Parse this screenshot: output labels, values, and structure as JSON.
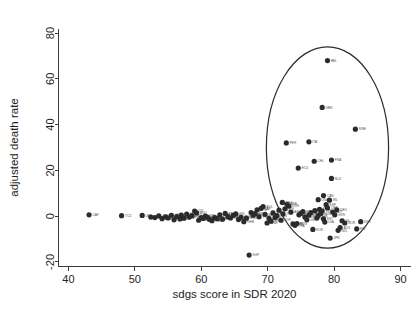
{
  "chart_data": {
    "type": "scatter",
    "title": "",
    "xlabel": "sdgs score in SDR 2020",
    "ylabel": "adjusted death rate",
    "xlim": [
      38.5,
      91.5
    ],
    "ylim": [
      -22,
      82
    ],
    "xticks": [
      40,
      50,
      60,
      70,
      80,
      90
    ],
    "yticks": [
      -20,
      0,
      20,
      40,
      60,
      80
    ],
    "grid": false,
    "legend": false,
    "marker_color": "#2b2b2b",
    "annotation": {
      "type": "ellipse",
      "label": "highlight-ellipse",
      "center_x": 79.0,
      "center_y": 30.0,
      "radius_x": 9.2,
      "radius_y": 44.0,
      "stroke": "#2f2f2f"
    },
    "points": [
      {
        "label": "CAF",
        "x": 43.1,
        "y": 0.6
      },
      {
        "label": "TCD",
        "x": 48.0,
        "y": 0.2
      },
      {
        "label": "LBR",
        "x": 51.1,
        "y": 0.3
      },
      {
        "label": "NER",
        "x": 52.4,
        "y": -0.4
      },
      {
        "label": "SOM",
        "x": 53.0,
        "y": -0.6
      },
      {
        "label": "COD",
        "x": 53.6,
        "y": 0.1
      },
      {
        "label": "SSD",
        "x": 54.1,
        "y": -1.1
      },
      {
        "label": "MLI",
        "x": 54.6,
        "y": -0.3
      },
      {
        "label": "BFA",
        "x": 55.0,
        "y": -0.8
      },
      {
        "label": "GIN",
        "x": 55.5,
        "y": 0.4
      },
      {
        "label": "MDG",
        "x": 55.9,
        "y": -1.6
      },
      {
        "label": "NGA",
        "x": 56.3,
        "y": -0.2
      },
      {
        "label": "MOZ",
        "x": 56.8,
        "y": -1.2
      },
      {
        "label": "AFG",
        "x": 57.0,
        "y": 0.5
      },
      {
        "label": "YEM",
        "x": 57.4,
        "y": -0.9
      },
      {
        "label": "SLE",
        "x": 57.8,
        "y": 0.9
      },
      {
        "label": "BEN",
        "x": 58.2,
        "y": -0.4
      },
      {
        "label": "TGO",
        "x": 58.6,
        "y": 0.2
      },
      {
        "label": "CIV",
        "x": 59.0,
        "y": 2.2
      },
      {
        "label": "AGO",
        "x": 59.3,
        "y": 1.4
      },
      {
        "label": "MWI",
        "x": 59.6,
        "y": -1.8
      },
      {
        "label": "ZMB",
        "x": 60.0,
        "y": -0.6
      },
      {
        "label": "TZA",
        "x": 60.3,
        "y": -1.0
      },
      {
        "label": "SDN",
        "x": 60.6,
        "y": 0.0
      },
      {
        "label": "CMR",
        "x": 60.9,
        "y": -0.4
      },
      {
        "label": "UGA",
        "x": 61.2,
        "y": -1.4
      },
      {
        "label": "RWA",
        "x": 61.6,
        "y": -2.0
      },
      {
        "label": "SEN",
        "x": 62.0,
        "y": -0.6
      },
      {
        "label": "ETH",
        "x": 62.4,
        "y": -1.1
      },
      {
        "label": "GHA",
        "x": 62.8,
        "y": 0.6
      },
      {
        "label": "LAO",
        "x": 63.2,
        "y": -1.3
      },
      {
        "label": "PAK",
        "x": 63.6,
        "y": 1.2
      },
      {
        "label": "ZWE",
        "x": 64.0,
        "y": -0.2
      },
      {
        "label": "KEN",
        "x": 64.4,
        "y": -0.8
      },
      {
        "label": "HTI",
        "x": 64.8,
        "y": 0.3
      },
      {
        "label": "IND",
        "x": 65.2,
        "y": 1.0
      },
      {
        "label": "NPL",
        "x": 65.6,
        "y": -1.5
      },
      {
        "label": "BGD",
        "x": 66.0,
        "y": -0.5
      },
      {
        "label": "KHM",
        "x": 66.4,
        "y": -2.4
      },
      {
        "label": "MMR",
        "x": 66.8,
        "y": -0.9
      },
      {
        "label": "SGP",
        "x": 67.2,
        "y": -17.0
      },
      {
        "label": "IRQ",
        "x": 67.5,
        "y": 1.6
      },
      {
        "label": "PHL",
        "x": 67.8,
        "y": 0.4
      },
      {
        "label": "IDN",
        "x": 68.1,
        "y": 1.1
      },
      {
        "label": "GTM",
        "x": 68.4,
        "y": 2.8
      },
      {
        "label": "EGY",
        "x": 68.7,
        "y": -0.3
      },
      {
        "label": "ZAF",
        "x": 69.0,
        "y": 3.4
      },
      {
        "label": "BOL",
        "x": 69.3,
        "y": 4.2
      },
      {
        "label": "MAR",
        "x": 69.6,
        "y": 0.8
      },
      {
        "label": "VNM",
        "x": 69.9,
        "y": -3.0
      },
      {
        "label": "HND",
        "x": 70.2,
        "y": -1.0
      },
      {
        "label": "PRY",
        "x": 70.5,
        "y": -2.2
      },
      {
        "label": "DOM",
        "x": 70.8,
        "y": 1.4
      },
      {
        "label": "SLV",
        "x": 71.1,
        "y": -0.6
      },
      {
        "label": "PAN",
        "x": 71.4,
        "y": 0.2
      },
      {
        "label": "COL",
        "x": 71.7,
        "y": 2.6
      },
      {
        "label": "JOR",
        "x": 72.0,
        "y": -1.8
      },
      {
        "label": "TUR",
        "x": 72.3,
        "y": 1.0
      },
      {
        "label": "IRN",
        "x": 72.6,
        "y": 3.2
      },
      {
        "label": "BRA",
        "x": 72.9,
        "y": 5.2
      },
      {
        "label": "MEX",
        "x": 72.2,
        "y": 6.0
      },
      {
        "label": "RUS",
        "x": 73.2,
        "y": 4.4
      },
      {
        "label": "ARG",
        "x": 73.5,
        "y": 1.8
      },
      {
        "label": "CHN",
        "x": 73.8,
        "y": -3.4
      },
      {
        "label": "THA",
        "x": 74.1,
        "y": -4.0
      },
      {
        "label": "MYS",
        "x": 74.4,
        "y": -3.2
      },
      {
        "label": "UKR",
        "x": 74.7,
        "y": 0.6
      },
      {
        "label": "ROU",
        "x": 75.0,
        "y": 1.2
      },
      {
        "label": "BGR",
        "x": 75.3,
        "y": 2.0
      },
      {
        "label": "ECU",
        "x": 74.6,
        "y": 21.0
      },
      {
        "label": "PER",
        "x": 72.8,
        "y": 32.0
      },
      {
        "label": "SRB",
        "x": 75.6,
        "y": -0.4
      },
      {
        "label": "GRC",
        "x": 75.9,
        "y": -1.6
      },
      {
        "label": "HRV",
        "x": 76.2,
        "y": 0.4
      },
      {
        "label": "ISR",
        "x": 76.5,
        "y": 1.6
      },
      {
        "label": "KOR",
        "x": 76.8,
        "y": -5.8
      },
      {
        "label": "PRT",
        "x": 77.1,
        "y": 2.4
      },
      {
        "label": "LTU",
        "x": 77.4,
        "y": -0.8
      },
      {
        "label": "SVK",
        "x": 77.6,
        "y": 0.2
      },
      {
        "label": "POL",
        "x": 77.8,
        "y": 3.0
      },
      {
        "label": "HUN",
        "x": 78.0,
        "y": 1.2
      },
      {
        "label": "CZE",
        "x": 78.2,
        "y": 2.2
      },
      {
        "label": "EST",
        "x": 78.4,
        "y": -1.2
      },
      {
        "label": "LVA",
        "x": 78.6,
        "y": -2.6
      },
      {
        "label": "ESP",
        "x": 78.8,
        "y": 5.0
      },
      {
        "label": "CHE",
        "x": 79.0,
        "y": 3.6
      },
      {
        "label": "USA",
        "x": 77.6,
        "y": 7.2
      },
      {
        "label": "CAN",
        "x": 78.4,
        "y": 9.0
      },
      {
        "label": "IRL",
        "x": 79.3,
        "y": 7.0
      },
      {
        "label": "NLD",
        "x": 79.6,
        "y": 16.5
      },
      {
        "label": "CHL",
        "x": 77.0,
        "y": 24.0
      },
      {
        "label": "FRA",
        "x": 79.6,
        "y": 24.5
      },
      {
        "label": "ITA",
        "x": 76.2,
        "y": 32.5
      },
      {
        "label": "GBR",
        "x": 78.2,
        "y": 47.5
      },
      {
        "label": "BEL",
        "x": 79.0,
        "y": 68.0
      },
      {
        "label": "SWE",
        "x": 83.2,
        "y": 38.0
      },
      {
        "label": "AUT",
        "x": 79.8,
        "y": 1.8
      },
      {
        "label": "SVN",
        "x": 80.1,
        "y": 0.6
      },
      {
        "label": "DEU",
        "x": 80.4,
        "y": 2.8
      },
      {
        "label": "NZL",
        "x": 80.6,
        "y": -6.2
      },
      {
        "label": "AUS",
        "x": 80.9,
        "y": -5.0
      },
      {
        "label": "JPN",
        "x": 79.4,
        "y": -9.6
      },
      {
        "label": "ISL",
        "x": 81.2,
        "y": -2.0
      },
      {
        "label": "NOR",
        "x": 81.6,
        "y": -3.0
      },
      {
        "label": "DNK",
        "x": 84.0,
        "y": -2.4
      },
      {
        "label": "FIN",
        "x": 83.4,
        "y": -5.6
      }
    ]
  }
}
